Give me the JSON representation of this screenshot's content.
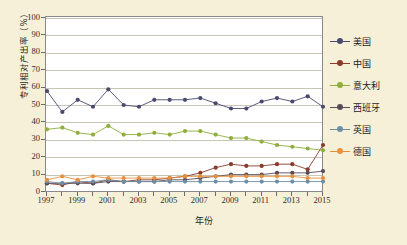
{
  "chart_data": {
    "type": "line",
    "title": "",
    "xlabel": "年份",
    "ylabel": "专利相对产出率（%）",
    "x": [
      1997,
      1998,
      1999,
      2000,
      2001,
      2002,
      2003,
      2004,
      2005,
      2006,
      2007,
      2008,
      2009,
      2010,
      2011,
      2012,
      2013,
      2014,
      2015
    ],
    "xticklabels": [
      "1997",
      "1999",
      "2001",
      "2003",
      "2005",
      "2007",
      "2009",
      "2011",
      "2013",
      "2015"
    ],
    "xtickvalues": [
      1997,
      1999,
      2001,
      2003,
      2005,
      2007,
      2009,
      2011,
      2013,
      2015
    ],
    "ylim": [
      0,
      100
    ],
    "yticks": [
      0,
      10,
      20,
      30,
      40,
      50,
      60,
      70,
      80,
      90,
      100
    ],
    "yticklabels": [
      "0",
      "10",
      "20",
      "30",
      "40",
      "50",
      "60",
      "70",
      "80",
      "90",
      "100"
    ],
    "grid": true,
    "legend_position": "right",
    "series": [
      {
        "name": "美国",
        "color": "#4a4a6e",
        "values": [
          58,
          46,
          53,
          49,
          59,
          50,
          49,
          53,
          53,
          53,
          54,
          51,
          48,
          48,
          52,
          54,
          52,
          55,
          49
        ]
      },
      {
        "name": "中国",
        "color": "#8a3b2a",
        "values": [
          5,
          4,
          6,
          5,
          7,
          6,
          7,
          7,
          8,
          9,
          11,
          14,
          16,
          15,
          15,
          16,
          16,
          13,
          27
        ]
      },
      {
        "name": "意大利",
        "color": "#8fae3c",
        "values": [
          36,
          37,
          34,
          33,
          38,
          33,
          33,
          34,
          33,
          35,
          35,
          33,
          31,
          31,
          29,
          27,
          26,
          25,
          24
        ]
      },
      {
        "name": "西班牙",
        "color": "#5b4a57",
        "values": [
          5,
          5,
          5,
          5,
          6,
          6,
          6,
          6,
          7,
          7,
          8,
          9,
          10,
          10,
          10,
          11,
          11,
          11,
          12
        ]
      },
      {
        "name": "英国",
        "color": "#6d8fa6",
        "values": [
          6,
          5,
          6,
          6,
          7,
          6,
          6,
          6,
          6,
          6,
          6,
          6,
          6,
          6,
          6,
          6,
          6,
          6,
          6
        ]
      },
      {
        "name": "德国",
        "color": "#e8903c",
        "values": [
          7,
          9,
          7,
          9,
          8,
          8,
          8,
          8,
          8,
          9,
          9,
          9,
          9,
          9,
          9,
          9,
          9,
          8,
          8
        ]
      }
    ]
  },
  "legend": {
    "items": [
      {
        "label": "美国"
      },
      {
        "label": "中国"
      },
      {
        "label": "意大利"
      },
      {
        "label": "西班牙"
      },
      {
        "label": "英国"
      },
      {
        "label": "德国"
      }
    ]
  }
}
